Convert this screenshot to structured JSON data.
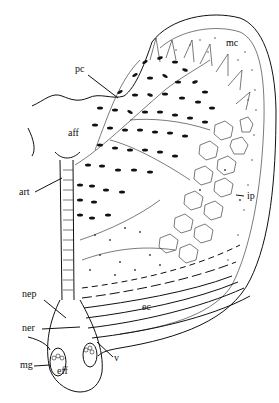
{
  "diagram": {
    "type": "anatomical-illustration",
    "labels": [
      {
        "id": "mc",
        "text": "mc",
        "x": 226,
        "y": 46
      },
      {
        "id": "pc",
        "text": "pc",
        "x": 75,
        "y": 72
      },
      {
        "id": "aff",
        "text": "aff",
        "x": 68,
        "y": 136
      },
      {
        "id": "art",
        "text": "art",
        "x": 19,
        "y": 195
      },
      {
        "id": "ip",
        "text": "ip",
        "x": 247,
        "y": 196
      },
      {
        "id": "ec",
        "text": "ec",
        "x": 142,
        "y": 310
      },
      {
        "id": "nep",
        "text": "nep",
        "x": 22,
        "y": 297
      },
      {
        "id": "ner",
        "text": "ner",
        "x": 22,
        "y": 331
      },
      {
        "id": "v",
        "text": "v",
        "x": 114,
        "y": 361
      },
      {
        "id": "mg",
        "text": "mg",
        "x": 20,
        "y": 368
      },
      {
        "id": "eff",
        "text": "eff",
        "x": 57,
        "y": 371
      }
    ]
  }
}
